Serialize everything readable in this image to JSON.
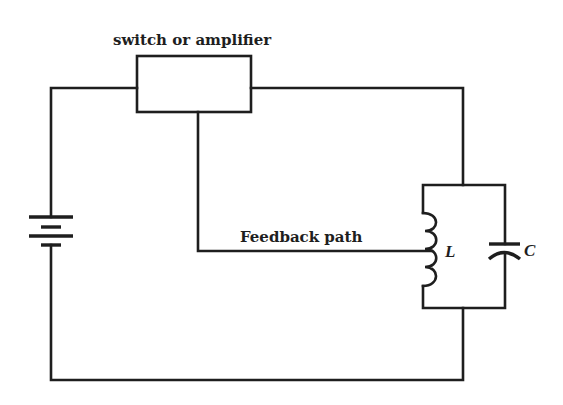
{
  "diagram": {
    "title": "",
    "colors": {
      "line": "#1e1e1e",
      "background": "#ffffff"
    },
    "labels": {
      "amplifier": "switch or amplifier",
      "feedback": "Feedback path",
      "inductor": "L",
      "capacitor": "C"
    },
    "components": [
      {
        "id": "amplifier",
        "type": "block",
        "label": "switch or amplifier"
      },
      {
        "id": "battery",
        "type": "dc-source",
        "label": ""
      },
      {
        "id": "inductor",
        "type": "inductor",
        "label": "L"
      },
      {
        "id": "capacitor",
        "type": "capacitor",
        "label": "C"
      }
    ],
    "connections": [
      {
        "from": "battery",
        "to": "amplifier",
        "note": "top-left wire"
      },
      {
        "from": "amplifier",
        "to": "tank-circuit",
        "note": "top-right wire"
      },
      {
        "from": "amplifier",
        "to": "inductor",
        "note": "Feedback path (tap on coil)"
      },
      {
        "from": "tank-circuit",
        "to": "battery",
        "note": "bottom return wire"
      },
      {
        "from": "inductor",
        "to": "capacitor",
        "note": "parallel LC tank"
      }
    ]
  }
}
